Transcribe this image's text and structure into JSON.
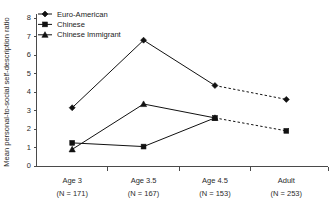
{
  "chart_data": {
    "type": "line",
    "title": "",
    "xlabel": "",
    "ylabel": "Mean personal-to-social self-description ratio",
    "ylim": [
      0,
      8
    ],
    "ytick_labels": [
      "0",
      "1",
      "2",
      "3",
      "4",
      "5",
      "6",
      "7",
      "8"
    ],
    "ytick_values": [
      0,
      1,
      2,
      3,
      4,
      5,
      6,
      7,
      8
    ],
    "grid": false,
    "legend_position": "top-left",
    "categories": [
      "Age 3",
      "Age 3.5",
      "Age 4.5",
      "Adult"
    ],
    "category_sublabels": [
      "(N = 171)",
      "(N = 167)",
      "(N = 153)",
      "(N = 253)"
    ],
    "series": [
      {
        "name": "Euro-American",
        "marker": "diamond",
        "values": [
          3.15,
          6.8,
          4.35,
          3.6
        ],
        "dashed_from_index": 2
      },
      {
        "name": "Chinese",
        "marker": "square",
        "values": [
          1.25,
          1.05,
          2.6,
          1.9
        ],
        "dashed_from_index": 2
      },
      {
        "name": "Chinese Immigrant",
        "marker": "triangle",
        "values": [
          0.9,
          3.35,
          2.6,
          null
        ],
        "dashed_from_index": null
      }
    ]
  },
  "legend": {
    "items": [
      {
        "label": "Euro-American"
      },
      {
        "label": "Chinese"
      },
      {
        "label": "Chinese Immigrant"
      }
    ]
  },
  "colors": {
    "ink": "#111111",
    "axis": "#4a4a4a",
    "background": "#ffffff"
  }
}
